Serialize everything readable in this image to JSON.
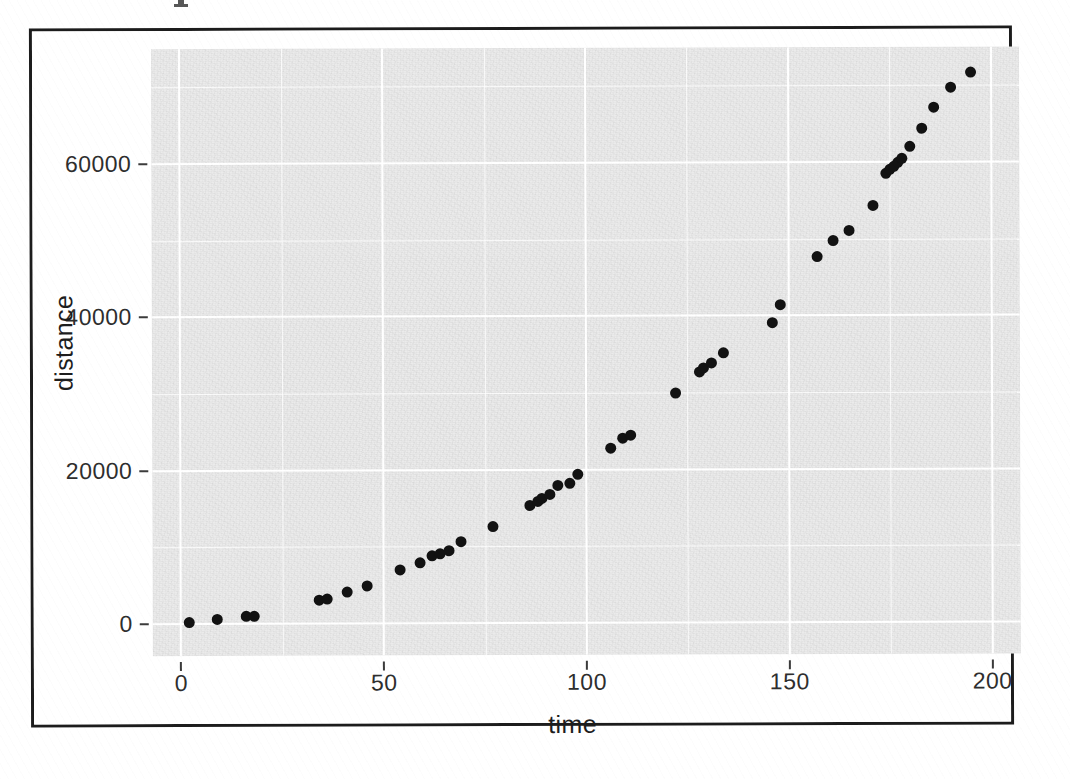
{
  "figure": {
    "background_color": "#ffffff",
    "panel_color": "#ebebeb",
    "grid_color": "#ffffff",
    "point_color": "#121212",
    "frame_color": "#1c1c1c"
  },
  "axes": {
    "x_title": "time",
    "y_title": "distance",
    "x_ticks": [
      "0",
      "50",
      "100",
      "150",
      "200"
    ],
    "y_ticks": [
      "0",
      "20000",
      "40000",
      "60000"
    ]
  },
  "chart_data": {
    "type": "scatter",
    "title": "",
    "subtitle": "",
    "xlabel": "time",
    "ylabel": "distance",
    "xlim": [
      -7,
      207
    ],
    "ylim": [
      -4200,
      75000
    ],
    "x_ticks": [
      0,
      50,
      100,
      150,
      200
    ],
    "y_ticks": [
      0,
      20000,
      40000,
      60000
    ],
    "x_minor_ticks": [
      25,
      75,
      125,
      175
    ],
    "y_minor_ticks": [
      10000,
      30000,
      50000,
      70000
    ],
    "grid": true,
    "grid_major_color": "#ffffff",
    "grid_minor_color": "#ffffff",
    "legend": null,
    "legend_position": "none",
    "annotations": [],
    "marker": "filled-circle",
    "marker_color": "#121212",
    "n_points": 47,
    "series": [
      {
        "name": "distance",
        "x": [
          2,
          9,
          16,
          18,
          34,
          36,
          41,
          46,
          54,
          59,
          62,
          64,
          66,
          69,
          77,
          86,
          88,
          89,
          91,
          93,
          96,
          98,
          106,
          109,
          111,
          122,
          128,
          129,
          131,
          134,
          146,
          148,
          157,
          161,
          165,
          171,
          174,
          175,
          176,
          177,
          178,
          180,
          183,
          186,
          190,
          195
        ],
        "y": [
          200,
          600,
          900,
          1000,
          3000,
          3200,
          4100,
          4900,
          6900,
          7900,
          8800,
          9100,
          9400,
          10600,
          12600,
          15300,
          15800,
          16200,
          16800,
          17900,
          18200,
          19300,
          22800,
          24000,
          24400,
          29900,
          32700,
          33200,
          33800,
          35100,
          39000,
          41400,
          47700,
          49700,
          51000,
          54300,
          58500,
          59000,
          59400,
          59900,
          60400,
          62000,
          64400,
          67100,
          69700,
          71700
        ]
      }
    ]
  }
}
